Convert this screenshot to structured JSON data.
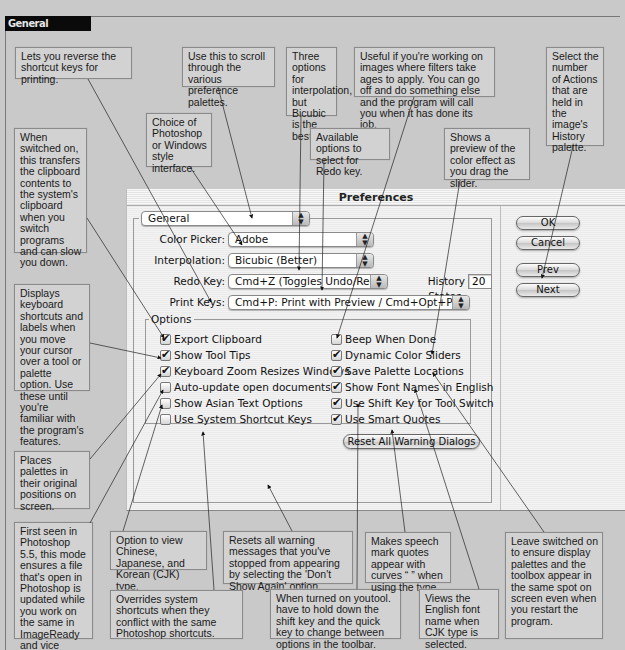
{
  "section": {
    "title": "General"
  },
  "dialog": {
    "title": "Preferences",
    "panel_select": "General",
    "fields": {
      "color_picker": {
        "label": "Color Picker:",
        "value": "Adobe"
      },
      "interpolation": {
        "label": "Interpolation:",
        "value": "Bicubic (Better)"
      },
      "redo_key": {
        "label": "Redo Key:",
        "value": "Cmd+Z (Toggles Undo/Redo)"
      },
      "history_states": {
        "label": "History States:",
        "value": "20"
      },
      "print_keys": {
        "label": "Print Keys:",
        "value": "Cmd+P: Print with Preview / Cmd+Opt+P: Print"
      }
    },
    "buttons": {
      "ok": "OK",
      "cancel": "Cancel",
      "prev": "Prev",
      "next": "Next",
      "reset": "Reset All Warning Dialogs"
    },
    "options": {
      "legend": "Options",
      "left": [
        {
          "label": "Export Clipboard",
          "checked": true
        },
        {
          "label": "Show Tool Tips",
          "checked": true
        },
        {
          "label": "Keyboard Zoom Resizes Windows",
          "checked": true
        },
        {
          "label": "Auto-update open documents",
          "checked": false
        },
        {
          "label": "Show Asian Text Options",
          "checked": false
        },
        {
          "label": "Use System Shortcut Keys",
          "checked": false
        }
      ],
      "right": [
        {
          "label": "Beep When Done",
          "checked": false
        },
        {
          "label": "Dynamic Color Sliders",
          "checked": true
        },
        {
          "label": "Save Palette Locations",
          "checked": true
        },
        {
          "label": "Show Font Names in English",
          "checked": true
        },
        {
          "label": "Use Shift Key for Tool Switch",
          "checked": true
        },
        {
          "label": "Use Smart Quotes",
          "checked": true
        }
      ]
    }
  },
  "callouts": {
    "print_keys": "Lets you reverse the shortcut keys for printing.",
    "panel_scroll": "Use this to scroll through the various preference palettes.",
    "interpolation": "Three options for interpolation, but Bicubic is the best.",
    "beep": "Useful if you're working on images where filters take ages to apply. You can go off and do something else and the program will call you when it has done its job.",
    "history": "Select the number of Actions that are held in the image's History palette.",
    "color_picker": "Choice of Photoshop or Windows style interface.",
    "redo": "Available options to select for Redo key.",
    "color_sliders": "Shows a preview of the color effect as you drag the slider.",
    "export_clipboard": "When switched on, this transfers the clipboard contents to the system's clipboard when you switch programs and can slow you down.",
    "tool_tips": "Displays keyboard shortcuts and labels when you move your cursor over a tool or palette option. Use these until you're familiar with the program's features.",
    "zoom_resize": "Places palettes in their original positions on screen.",
    "auto_update": "First seen in Photoshop 5.5, this mode ensures a file that's open in Photoshop is updated while you work on the same in ImageReady and vice versa.",
    "asian_text": "Option to view Chinese, Japanese, and Korean (CJK) type.",
    "system_shortcuts": "Overrides system shortcuts when they conflict with the same Photoshop shortcuts.",
    "reset_warnings": "Resets all warning messages that you've stopped from appearing by selecting the 'Don't Show Again' option.",
    "shift_key": "When turned on you have to hold down the shift key and the quick key to change between options in the toolbar.",
    "smart_quotes": "Makes speech mark quotes appear with curves “ ” when using the type tool.",
    "font_names": "Views the English font name when CJK type is selected.",
    "palette_locations": "Leave switched on to ensure display palettes and the toolbox appear in the same spot on screen even when you restart the program."
  }
}
